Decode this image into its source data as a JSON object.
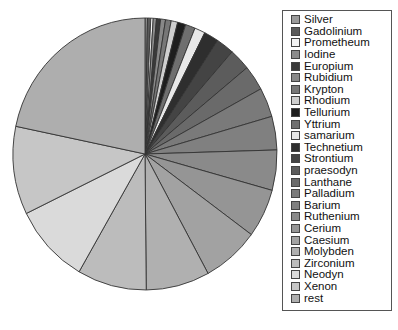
{
  "chart_data": {
    "type": "pie",
    "title": "",
    "start_angle": "12 o'clock",
    "direction": "clockwise",
    "legend_position": "right",
    "categories": [
      "Silver",
      "Gadolinium",
      "Prometheum",
      "Iodine",
      "Europium",
      "Rubidium",
      "Krypton",
      "Rhodium",
      "Tellurium",
      "Yttrium",
      "samarium",
      "Technetium",
      "Strontium",
      "praesodyn",
      "Lanthane",
      "Palladium",
      "Barium",
      "Ruthenium",
      "Cerium",
      "Caesium",
      "Molybden",
      "Zirconium",
      "Neodyn",
      "Xenon",
      "rest"
    ],
    "values": [
      0.3,
      0.4,
      0.3,
      0.4,
      0.5,
      0.6,
      0.7,
      0.8,
      1.0,
      1.2,
      1.3,
      1.8,
      2.2,
      2.6,
      3.0,
      3.5,
      4.0,
      4.8,
      5.8,
      7.0,
      7.8,
      8.5,
      9.5,
      10.5,
      21.8
    ],
    "colors": [
      "#9a9a9a",
      "#5a5a5a",
      "#f4f4f4",
      "#8c8c8c",
      "#3a3a3a",
      "#888888",
      "#777777",
      "#cfcfcf",
      "#1e1e1e",
      "#6f6f6f",
      "#e8e8e8",
      "#2e2e2e",
      "#444444",
      "#5c5c5c",
      "#6a6a6a",
      "#7a7a7a",
      "#808080",
      "#8a8a8a",
      "#959595",
      "#a2a2a2",
      "#b0b0b0",
      "#bcbcbc",
      "#dadada",
      "#c6c6c6",
      "#aeaeae"
    ]
  },
  "legend": {
    "items": [
      {
        "label": "Silver"
      },
      {
        "label": "Gadolinium"
      },
      {
        "label": "Prometheum"
      },
      {
        "label": "Iodine"
      },
      {
        "label": "Europium"
      },
      {
        "label": "Rubidium"
      },
      {
        "label": "Krypton"
      },
      {
        "label": "Rhodium"
      },
      {
        "label": "Tellurium"
      },
      {
        "label": "Yttrium"
      },
      {
        "label": "samarium"
      },
      {
        "label": "Technetium"
      },
      {
        "label": "Strontium"
      },
      {
        "label": "praesodyn"
      },
      {
        "label": "Lanthane"
      },
      {
        "label": "Palladium"
      },
      {
        "label": "Barium"
      },
      {
        "label": "Ruthenium"
      },
      {
        "label": "Cerium"
      },
      {
        "label": "Caesium"
      },
      {
        "label": "Molybden"
      },
      {
        "label": "Zirconium"
      },
      {
        "label": "Neodyn"
      },
      {
        "label": "Xenon"
      },
      {
        "label": "rest"
      }
    ]
  }
}
